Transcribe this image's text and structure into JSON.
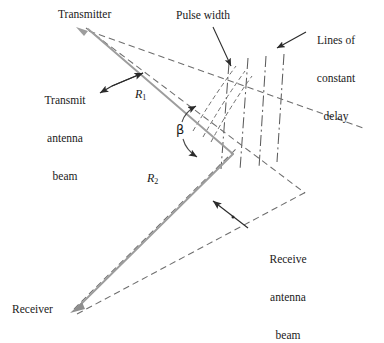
{
  "figure": {
    "type": "bistatic-radar-geometry-diagram",
    "background_color": "#ffffff",
    "colors": {
      "range_line": "#9d9d9d",
      "dashed_beam": "#6e6e6e",
      "dash_dot_delay": "#5d5d5d",
      "annotation_arrow": "#2b2b2b",
      "text": "#1a1a1a"
    }
  },
  "labels": {
    "transmitter": "Transmitter",
    "receiver": "Receiver",
    "pulse_width": "Pulse width",
    "lines_of_constant_delay_1": "Lines of",
    "lines_of_constant_delay_2": "constant",
    "lines_of_constant_delay_3": "delay",
    "transmit_beam_1": "Transmit",
    "transmit_beam_2": "antenna",
    "transmit_beam_3": "beam",
    "receive_beam_1": "Receive",
    "receive_beam_2": "antenna",
    "receive_beam_3": "beam",
    "range_r1": "R",
    "range_r1_sub": "1",
    "range_r2": "R",
    "range_r2_sub": "2",
    "bistatic_angle": "β"
  },
  "geometry": {
    "transmitter_point": [
      86,
      27
    ],
    "receiver_point": [
      73,
      311
    ],
    "intersection_point": [
      232,
      153
    ],
    "r1_line": [
      [
        86,
        27
      ],
      [
        232,
        153
      ]
    ],
    "r2_line": [
      [
        73,
        311
      ],
      [
        232,
        153
      ]
    ],
    "transmit_beam_upper_edge": [
      [
        88,
        30
      ],
      [
        365,
        128
      ]
    ],
    "transmit_beam_lower_edge": [
      [
        86,
        27
      ],
      [
        300,
        190
      ]
    ],
    "receive_beam_upper_edge": [
      [
        73,
        311
      ],
      [
        232,
        153
      ]
    ],
    "receive_beam_lower_edge": [
      [
        76,
        314
      ],
      [
        300,
        195
      ]
    ],
    "pulse_width_arc_1": [
      [
        196,
        132
      ],
      [
        238,
        66
      ]
    ],
    "pulse_width_arc_2": [
      [
        205,
        137
      ],
      [
        247,
        71
      ]
    ],
    "delay_lines_count": 4
  }
}
